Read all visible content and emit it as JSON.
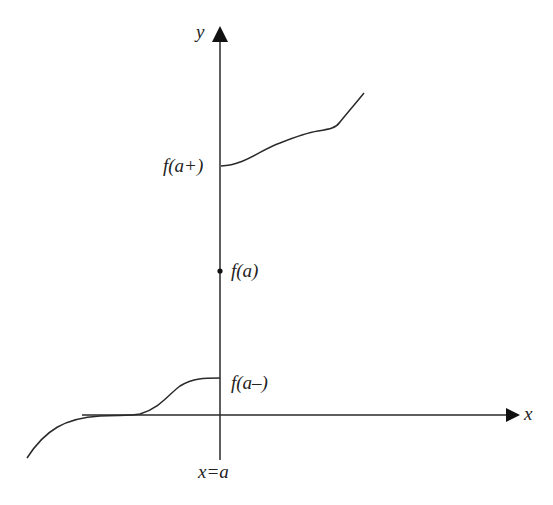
{
  "diagram": {
    "type": "jump-discontinuity graph",
    "axes": {
      "x_label": "x",
      "y_label": "y",
      "vertical_line_label": "x=a"
    },
    "annotations": {
      "upper_limit": "f(a+)",
      "point_value": "f(a)",
      "lower_limit": "f(a–)"
    },
    "colors": {
      "stroke": "#2a2a2a",
      "text": "#222222",
      "background": "#ffffff"
    }
  }
}
